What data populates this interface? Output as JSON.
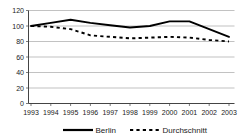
{
  "chart_data": {
    "type": "line",
    "title": "",
    "xlabel": "",
    "ylabel": "",
    "categories": [
      "1993",
      "1994",
      "1995",
      "1996",
      "1997",
      "1998",
      "1999",
      "2000",
      "2001",
      "2002",
      "2003"
    ],
    "series": [
      {
        "name": "Berlin",
        "style": "solid",
        "values": [
          100,
          104,
          108,
          104,
          101,
          98,
          100,
          106,
          106,
          96,
          86
        ]
      },
      {
        "name": "Durchschnitt",
        "style": "dashed",
        "values": [
          100,
          99,
          96,
          88,
          86,
          84,
          85,
          86,
          85,
          82,
          80
        ]
      }
    ],
    "ylim": [
      0,
      120
    ],
    "ytick_step": 20,
    "yticks": [
      "0",
      "20",
      "40",
      "60",
      "80",
      "100",
      "120"
    ],
    "grid": true,
    "grid_axis": "y",
    "legend_position": "bottom",
    "legend": [
      {
        "label": "Berlin",
        "style": "solid"
      },
      {
        "label": "Durchschnitt",
        "style": "dashed"
      }
    ],
    "colors": {
      "series_line": "#000000",
      "gridline": "#a8a8a8",
      "axis": "#444444",
      "background": "#ffffff",
      "text": "#1a1a1a"
    }
  }
}
